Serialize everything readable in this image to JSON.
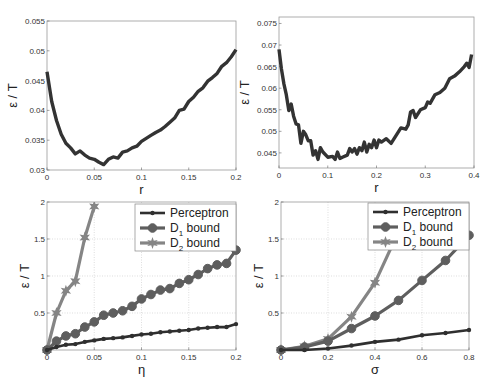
{
  "chart_data": [
    {
      "id": "top-left",
      "type": "line",
      "title": "",
      "xlabel": "r",
      "ylabel": "ε / T",
      "xlim": [
        0,
        0.2
      ],
      "ylim": [
        0.03,
        0.055
      ],
      "xticks": [
        0,
        0.05,
        0.1,
        0.15,
        0.2
      ],
      "xtick_labels": [
        "0",
        "0.05",
        "0.1",
        "0.15",
        "0.2"
      ],
      "yticks": [
        0.03,
        0.035,
        0.04,
        0.045,
        0.05,
        0.055
      ],
      "ytick_labels": [
        "0.03",
        "0.035",
        "0.04",
        "0.045",
        "0.05",
        "0.055"
      ],
      "grid": false,
      "series": [
        {
          "name": "error",
          "color": "#333333",
          "x": [
            0,
            0.005,
            0.01,
            0.015,
            0.02,
            0.025,
            0.03,
            0.035,
            0.04,
            0.045,
            0.05,
            0.055,
            0.06,
            0.065,
            0.07,
            0.075,
            0.08,
            0.085,
            0.09,
            0.095,
            0.1,
            0.105,
            0.11,
            0.115,
            0.12,
            0.125,
            0.13,
            0.135,
            0.14,
            0.145,
            0.15,
            0.155,
            0.16,
            0.165,
            0.17,
            0.175,
            0.18,
            0.185,
            0.19,
            0.195,
            0.2
          ],
          "y": [
            0.0465,
            0.0415,
            0.0383,
            0.036,
            0.0345,
            0.0337,
            0.0327,
            0.0332,
            0.0325,
            0.032,
            0.0318,
            0.0313,
            0.0309,
            0.0318,
            0.0322,
            0.032,
            0.033,
            0.0332,
            0.0337,
            0.034,
            0.0348,
            0.0353,
            0.0358,
            0.0363,
            0.0367,
            0.0373,
            0.038,
            0.0387,
            0.04,
            0.0402,
            0.0415,
            0.0422,
            0.0432,
            0.0438,
            0.0449,
            0.0455,
            0.0462,
            0.0474,
            0.048,
            0.049,
            0.0502
          ]
        }
      ]
    },
    {
      "id": "top-right",
      "type": "line",
      "title": "",
      "xlabel": "r",
      "ylabel": "ε / T",
      "xlim": [
        0,
        0.4
      ],
      "ylim": [
        0.0415,
        0.0765
      ],
      "xticks": [
        0,
        0.1,
        0.2,
        0.3,
        0.4
      ],
      "xtick_labels": [
        "0",
        "0.1",
        "0.2",
        "0.3",
        "0.4"
      ],
      "yticks": [
        0.045,
        0.05,
        0.055,
        0.06,
        0.065,
        0.07,
        0.075
      ],
      "ytick_labels": [
        "0.045",
        "0.05",
        "0.055",
        "0.06",
        "0.065",
        "0.07",
        "0.075"
      ],
      "grid": false,
      "series": [
        {
          "name": "error",
          "color": "#333333",
          "x": [
            0,
            0.005,
            0.01,
            0.015,
            0.02,
            0.025,
            0.03,
            0.035,
            0.04,
            0.045,
            0.05,
            0.055,
            0.06,
            0.065,
            0.07,
            0.075,
            0.08,
            0.085,
            0.09,
            0.1,
            0.11,
            0.115,
            0.12,
            0.125,
            0.13,
            0.14,
            0.145,
            0.15,
            0.155,
            0.16,
            0.165,
            0.17,
            0.175,
            0.18,
            0.185,
            0.19,
            0.195,
            0.2,
            0.205,
            0.21,
            0.22,
            0.23,
            0.24,
            0.25,
            0.26,
            0.265,
            0.27,
            0.275,
            0.28,
            0.29,
            0.3,
            0.305,
            0.31,
            0.32,
            0.33,
            0.34,
            0.35,
            0.36,
            0.37,
            0.38,
            0.385,
            0.39,
            0.395
          ],
          "y": [
            0.069,
            0.0645,
            0.061,
            0.0585,
            0.0548,
            0.0563,
            0.0535,
            0.0517,
            0.0515,
            0.0472,
            0.05,
            0.0492,
            0.0478,
            0.0478,
            0.0445,
            0.0455,
            0.0435,
            0.0462,
            0.0452,
            0.044,
            0.0442,
            0.0435,
            0.0452,
            0.0437,
            0.044,
            0.0445,
            0.046,
            0.0452,
            0.046,
            0.0447,
            0.0462,
            0.0455,
            0.0475,
            0.0452,
            0.047,
            0.0462,
            0.048,
            0.0462,
            0.048,
            0.0475,
            0.0483,
            0.0472,
            0.049,
            0.0508,
            0.0505,
            0.0515,
            0.0545,
            0.0548,
            0.0532,
            0.055,
            0.0555,
            0.0568,
            0.0565,
            0.0585,
            0.059,
            0.06,
            0.0622,
            0.0628,
            0.0638,
            0.065,
            0.0658,
            0.0648,
            0.0678
          ]
        }
      ]
    },
    {
      "id": "bottom-left",
      "type": "line",
      "title": "",
      "xlabel": "η",
      "ylabel": "ε / T",
      "xlim": [
        0,
        0.2
      ],
      "ylim": [
        0,
        2
      ],
      "xticks": [
        0,
        0.05,
        0.1,
        0.15,
        0.2
      ],
      "xtick_labels": [
        "0",
        "0.05",
        "0.1",
        "0.15",
        "0.2"
      ],
      "yticks": [
        0.5,
        1,
        1.5,
        2
      ],
      "ytick_labels": [
        "0.5",
        "1",
        "1.5",
        "2"
      ],
      "grid": true,
      "legend": {
        "position": "upper right",
        "entries": [
          "Perceptron",
          "D1 bound",
          "D2 bound"
        ]
      },
      "series": [
        {
          "name": "Perceptron",
          "color": "#2f2f2f",
          "marker": "dot",
          "x": [
            0,
            0.01,
            0.02,
            0.03,
            0.04,
            0.05,
            0.06,
            0.07,
            0.08,
            0.09,
            0.1,
            0.11,
            0.12,
            0.13,
            0.14,
            0.15,
            0.16,
            0.17,
            0.18,
            0.19,
            0.2
          ],
          "y": [
            0,
            0.04,
            0.07,
            0.08,
            0.11,
            0.13,
            0.15,
            0.16,
            0.17,
            0.19,
            0.21,
            0.22,
            0.24,
            0.25,
            0.26,
            0.27,
            0.29,
            0.3,
            0.31,
            0.31,
            0.35
          ]
        },
        {
          "name": "D1 bound",
          "color": "#5e5e5e",
          "marker": "circle",
          "x": [
            0,
            0.01,
            0.02,
            0.03,
            0.04,
            0.05,
            0.06,
            0.07,
            0.08,
            0.09,
            0.1,
            0.11,
            0.12,
            0.13,
            0.14,
            0.15,
            0.16,
            0.17,
            0.18,
            0.19,
            0.2
          ],
          "y": [
            0,
            0.12,
            0.19,
            0.22,
            0.31,
            0.38,
            0.47,
            0.5,
            0.53,
            0.59,
            0.69,
            0.75,
            0.81,
            0.83,
            0.9,
            0.95,
            1.02,
            1.1,
            1.15,
            1.17,
            1.35
          ]
        },
        {
          "name": "D2 bound",
          "color": "#858585",
          "marker": "star",
          "x": [
            0,
            0.01,
            0.02,
            0.03,
            0.04,
            0.05
          ],
          "y": [
            0,
            0.5,
            0.8,
            0.93,
            1.52,
            1.94
          ]
        }
      ]
    },
    {
      "id": "bottom-right",
      "type": "line",
      "title": "",
      "xlabel": "σ",
      "ylabel": "ε / T",
      "xlim": [
        0,
        0.8
      ],
      "ylim": [
        0,
        2
      ],
      "xticks": [
        0,
        0.2,
        0.4,
        0.6,
        0.8
      ],
      "xtick_labels": [
        "0",
        "0.2",
        "0.4",
        "0.6",
        "0.8"
      ],
      "yticks": [
        0.5,
        1,
        1.5,
        2
      ],
      "ytick_labels": [
        "0.5",
        "1",
        "1.5",
        "2"
      ],
      "grid": true,
      "legend": {
        "position": "upper right",
        "entries": [
          "Perceptron",
          "D1 bound",
          "D2 bound"
        ]
      },
      "series": [
        {
          "name": "Perceptron",
          "color": "#2f2f2f",
          "marker": "dot",
          "x": [
            0,
            0.1,
            0.2,
            0.3,
            0.4,
            0.5,
            0.6,
            0.7,
            0.8
          ],
          "y": [
            0,
            0.0,
            0.02,
            0.06,
            0.11,
            0.14,
            0.2,
            0.23,
            0.27
          ]
        },
        {
          "name": "D1 bound",
          "color": "#5e5e5e",
          "marker": "circle",
          "x": [
            0,
            0.1,
            0.2,
            0.3,
            0.4,
            0.5,
            0.6,
            0.7,
            0.8
          ],
          "y": [
            0,
            0.04,
            0.12,
            0.29,
            0.46,
            0.67,
            0.94,
            1.21,
            1.55
          ]
        },
        {
          "name": "D2 bound",
          "color": "#858585",
          "marker": "star",
          "x": [
            0,
            0.1,
            0.2,
            0.3,
            0.4,
            0.5
          ],
          "y": [
            0,
            0.05,
            0.15,
            0.45,
            0.91,
            1.6
          ]
        }
      ]
    }
  ],
  "legend_labels": {
    "perceptron": "Perceptron",
    "d1_main": "D",
    "d1_sub": "1",
    "d1_rest": " bound",
    "d2_main": "D",
    "d2_sub": "2",
    "d2_rest": " bound"
  }
}
